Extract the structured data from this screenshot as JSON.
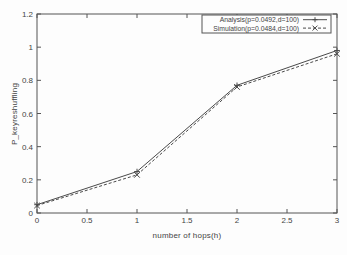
{
  "figure": {
    "background": "#fdfdfd",
    "axis_color": "#555555",
    "text_color": "#444444"
  },
  "chart_data": {
    "type": "line",
    "title": "",
    "xlabel": "number of hops(h)",
    "ylabel": "P_keyreshuffling",
    "xlim": [
      0,
      3
    ],
    "ylim": [
      0,
      1.2
    ],
    "xtick_values": [
      0,
      0.5,
      1,
      1.5,
      2,
      2.5,
      3
    ],
    "xtick_labels": [
      "0",
      "0.5",
      "1",
      "1.5",
      "2",
      "2.5",
      "3"
    ],
    "ytick_values": [
      0,
      0.2,
      0.4,
      0.6,
      0.8,
      1,
      1.2
    ],
    "ytick_labels": [
      "0",
      "0.2",
      "0.4",
      "0.6",
      "0.8",
      "1",
      "1.2"
    ],
    "grid": false,
    "legend_position": "top-right",
    "x": [
      0,
      1,
      2,
      3
    ],
    "series": [
      {
        "name": "Analysis(p=0.0492,d=100)",
        "values": [
          0.05,
          0.25,
          0.77,
          0.98
        ],
        "line": "solid",
        "marker": "+",
        "color": "#4a4a4a"
      },
      {
        "name": "Simulation(p=0.0484,d=100)",
        "values": [
          0.045,
          0.23,
          0.76,
          0.96
        ],
        "line": "dashed",
        "marker": "x",
        "color": "#4a4a4a"
      }
    ]
  }
}
